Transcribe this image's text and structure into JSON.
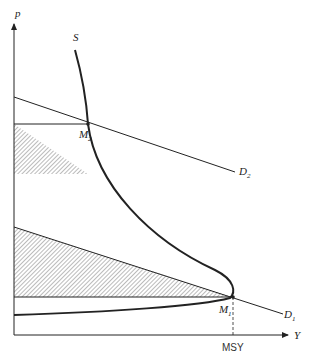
{
  "diagram": {
    "type": "economics-supply-demand",
    "axes": {
      "y_label": "p",
      "x_label": "Y"
    },
    "curves": {
      "supply": {
        "label": "S"
      },
      "demand_high": {
        "label": "D",
        "subscript": "2"
      },
      "demand_low": {
        "label": "D",
        "subscript": "1"
      }
    },
    "points": {
      "m2": {
        "label": "M",
        "subscript": "2"
      },
      "m1": {
        "label": "M",
        "subscript": "1"
      }
    },
    "markers": {
      "msy": {
        "label": "MSY"
      }
    },
    "colors": {
      "line": "#222222",
      "hatch": "#555555",
      "background": "#ffffff"
    }
  }
}
